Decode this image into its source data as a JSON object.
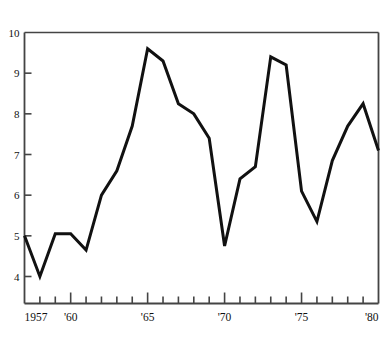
{
  "chart_data": {
    "type": "line",
    "title": "",
    "subtitle": "",
    "xlabel": "",
    "ylabel": "%",
    "ylim": [
      3.4,
      10
    ],
    "xlim": [
      1957,
      1980
    ],
    "grid": false,
    "legend": null,
    "y_ticks": [
      4,
      5,
      6,
      7,
      8,
      9,
      10
    ],
    "y_tick_labels": [
      "4",
      "5",
      "6",
      "7",
      "8",
      "9",
      "10"
    ],
    "x_ticks": [
      1957,
      1958,
      1959,
      1960,
      1961,
      1962,
      1963,
      1964,
      1965,
      1966,
      1967,
      1968,
      1969,
      1970,
      1971,
      1972,
      1973,
      1974,
      1975,
      1976,
      1977,
      1978,
      1979,
      1980
    ],
    "x_tick_labels": [
      {
        "x": 1957,
        "label": "1957"
      },
      {
        "x": 1960,
        "label": "'60"
      },
      {
        "x": 1965,
        "label": "'65"
      },
      {
        "x": 1970,
        "label": "'70"
      },
      {
        "x": 1975,
        "label": "'75"
      },
      {
        "x": 1980,
        "label": "'80"
      }
    ],
    "x": [
      1957,
      1958,
      1959,
      1960,
      1961,
      1962,
      1963,
      1964,
      1965,
      1966,
      1967,
      1968,
      1969,
      1970,
      1971,
      1972,
      1973,
      1974,
      1975,
      1976,
      1977,
      1978,
      1979,
      1980
    ],
    "values": [
      5.0,
      4.0,
      5.05,
      5.05,
      4.65,
      6.0,
      6.6,
      7.7,
      9.6,
      9.3,
      8.25,
      8.0,
      7.4,
      4.75,
      6.4,
      6.7,
      9.4,
      9.2,
      6.1,
      5.35,
      6.85,
      7.7,
      8.25,
      7.1
    ],
    "series": [
      {
        "name": "",
        "values": [
          5.0,
          4.0,
          5.05,
          5.05,
          4.65,
          6.0,
          6.6,
          7.7,
          9.6,
          9.3,
          8.25,
          8.0,
          7.4,
          4.75,
          6.4,
          6.7,
          9.4,
          9.2,
          6.1,
          5.35,
          6.85,
          7.7,
          8.25,
          7.1
        ],
        "color": "#111111",
        "line_width": 3
      }
    ],
    "colors": {
      "line": "#111111",
      "axis": "#444444",
      "background": "#ffffff",
      "text": "#111111"
    }
  }
}
